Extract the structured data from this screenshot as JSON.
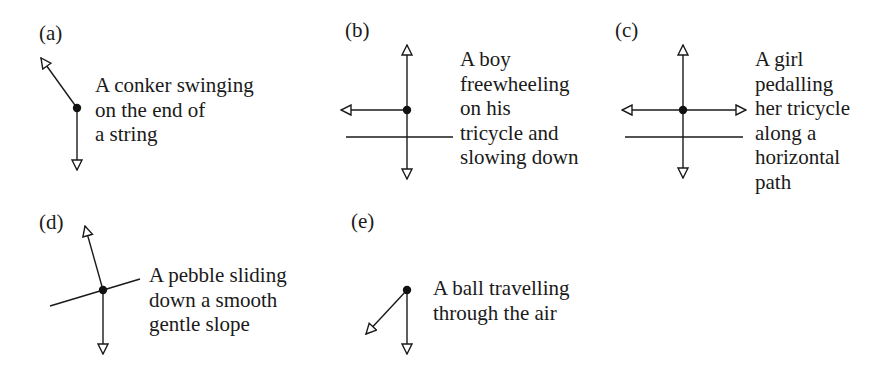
{
  "diagrams": [
    {
      "id": "a",
      "label": "(a)",
      "caption_lines": [
        "A conker swinging",
        "on the end of",
        "a string"
      ],
      "forces": [
        "tension (up-left along string)",
        "weight (down)"
      ]
    },
    {
      "id": "b",
      "label": "(b)",
      "caption_lines": [
        "A boy",
        "freewheeling",
        "on his",
        "tricycle and",
        "slowing down"
      ],
      "forces": [
        "normal reaction (up)",
        "weight (down)",
        "friction/resistance (left)"
      ]
    },
    {
      "id": "c",
      "label": "(c)",
      "caption_lines": [
        "A girl",
        "pedalling",
        "her tricycle",
        "along a",
        "horizontal",
        "path"
      ],
      "forces": [
        "normal reaction (up)",
        "weight (down)",
        "resistance (left)",
        "driving force (right)"
      ]
    },
    {
      "id": "d",
      "label": "(d)",
      "caption_lines": [
        "A pebble sliding",
        "down a smooth",
        "gentle slope"
      ],
      "forces": [
        "normal reaction (perpendicular to slope)",
        "weight (down)"
      ]
    },
    {
      "id": "e",
      "label": "(e)",
      "caption_lines": [
        "A ball travelling",
        "through the air"
      ],
      "forces": [
        "air resistance (down-left)",
        "weight (down)"
      ]
    }
  ],
  "style": {
    "stroke_color": "#1a1a1a",
    "arrowhead": "open-triangle",
    "point": "filled-circle"
  }
}
